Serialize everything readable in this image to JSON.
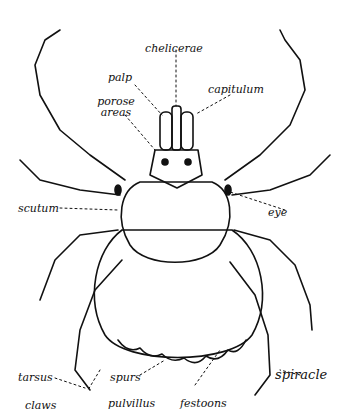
{
  "diagram": {
    "colors": {
      "ink": "#111111",
      "background": "#ffffff"
    },
    "labels": {
      "chelicerae": "chelicerae",
      "palp": "palp",
      "porose_areas": "porose areas",
      "capitulum": "capitulum",
      "scutum": "scutum",
      "eye": "eye",
      "tarsus": "tarsus",
      "claws": "claws",
      "spurs": "spurs",
      "pulvillus": "pulvillus",
      "festoons": "festoons",
      "spiracle": "spiracle"
    }
  }
}
